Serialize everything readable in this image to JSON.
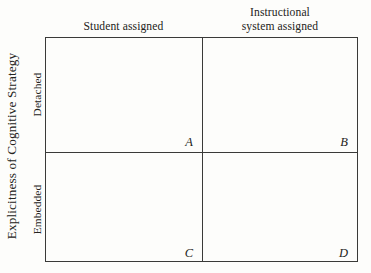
{
  "figure": {
    "type": "2x2-matrix",
    "axis_title_y": "Explicitness of Cognitive Strategy",
    "background_color": "#fdfdfb",
    "line_color": "#3a3a38",
    "text_color": "#242320"
  },
  "columns": [
    {
      "id": "student",
      "label": "Student assigned",
      "lines": [
        "Student assigned"
      ]
    },
    {
      "id": "system",
      "label": "Instructional system assigned",
      "lines": [
        "Instructional",
        "system assigned"
      ]
    }
  ],
  "rows": [
    {
      "id": "detached",
      "label": "Detached"
    },
    {
      "id": "embedded",
      "label": "Embedded"
    }
  ],
  "cells": [
    {
      "id": "a",
      "letter": "A",
      "row": "Detached",
      "column": "Student assigned"
    },
    {
      "id": "b",
      "letter": "B",
      "row": "Detached",
      "column": "Instructional system assigned"
    },
    {
      "id": "c",
      "letter": "C",
      "row": "Embedded",
      "column": "Student assigned"
    },
    {
      "id": "d",
      "letter": "D",
      "row": "Embedded",
      "column": "Instructional system assigned"
    }
  ]
}
